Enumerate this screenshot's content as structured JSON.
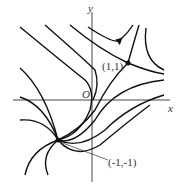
{
  "diagram": {
    "type": "phase-portrait",
    "axes": {
      "x_label": "x",
      "y_label": "y",
      "origin_label": "O"
    },
    "critical_points": [
      {
        "label": "(1,1)",
        "kind": "saddle"
      },
      {
        "label": "(-1,-1)",
        "kind": "spiral-source"
      }
    ],
    "colors": {
      "curve": "#111111",
      "axis": "#333333",
      "background": "#ffffff"
    }
  }
}
